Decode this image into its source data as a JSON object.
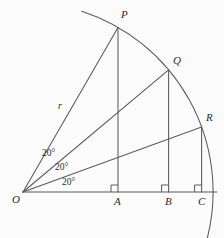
{
  "figure": {
    "type": "geometry-diagram",
    "background_color": "#fbfbfb",
    "stroke_color": "#5a5a5a",
    "label_color": "#2b2b2b"
  },
  "geometry": {
    "center": {
      "x": 23,
      "y": 192
    },
    "radius": 190,
    "arc_start_angle_deg": 72,
    "arc_end_angle_deg": -14,
    "rays": [
      {
        "name": "OP",
        "angle_deg": 60
      },
      {
        "name": "OQ",
        "angle_deg": 40
      },
      {
        "name": "OR",
        "angle_deg": 20
      }
    ],
    "baseline": {
      "x1": 23,
      "y1": 192,
      "x2": 217,
      "y2": 192
    }
  },
  "points": {
    "O": {
      "label": "O",
      "x": 23,
      "y": 192,
      "label_x": 13,
      "label_y": 196
    },
    "P": {
      "label": "P",
      "x": 118,
      "y": 28,
      "label_x": 121,
      "label_y": 10
    },
    "Q": {
      "label": "Q",
      "x": 169,
      "y": 70,
      "label_x": 173,
      "label_y": 56
    },
    "R": {
      "label": "R",
      "x": 202,
      "y": 127,
      "label_x": 206,
      "label_y": 113
    },
    "A": {
      "label": "A",
      "x": 118,
      "y": 192,
      "label_x": 114,
      "label_y": 196
    },
    "B": {
      "label": "B",
      "x": 169,
      "y": 192,
      "label_x": 165,
      "label_y": 196
    },
    "C": {
      "label": "C",
      "x": 202,
      "y": 192,
      "label_x": 198,
      "label_y": 196
    }
  },
  "labels": {
    "radius": {
      "text": "r",
      "x": 58,
      "y": 101
    },
    "angles": [
      {
        "text": "20°",
        "x": 42,
        "y": 149
      },
      {
        "text": "20°",
        "x": 55,
        "y": 163
      },
      {
        "text": "20°",
        "x": 62,
        "y": 178
      }
    ]
  },
  "right_angle_marks": [
    {
      "at": "A",
      "x": 112,
      "y": 186,
      "size": 6
    },
    {
      "at": "B",
      "x": 163,
      "y": 186,
      "size": 6
    },
    {
      "at": "C",
      "x": 196,
      "y": 186,
      "size": 6
    }
  ]
}
